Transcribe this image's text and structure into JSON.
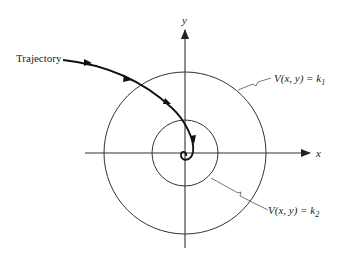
{
  "diagram": {
    "type": "lyapunov-level-curves",
    "colors": {
      "stroke": "#333333",
      "trajectory": "#111111",
      "background": "#ffffff"
    },
    "axes": {
      "x_label": "x",
      "y_label": "y"
    },
    "trajectory": {
      "label": "Trajectory",
      "arrow_count": 4
    },
    "level_curves": [
      {
        "name": "outer",
        "label_lhs": "V(x, y) = k",
        "subscript": "1"
      },
      {
        "name": "inner",
        "label_lhs": "V(x, y) = k",
        "subscript": "2"
      }
    ]
  }
}
